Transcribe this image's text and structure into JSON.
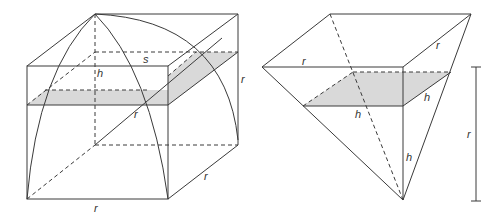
{
  "figure": {
    "left": {
      "title": "Cube containing quarter hemisphere with horizontal cross-section",
      "labels": {
        "s": "s",
        "h": "h",
        "r_diag": "r",
        "r_right": "r",
        "r_depth": "r",
        "r_bottom": "r"
      }
    },
    "right": {
      "title": "Inverted square pyramid with horizontal cross-section",
      "labels": {
        "r_left_top": "r",
        "r_right_top": "r",
        "h_side": "h",
        "h_front": "h",
        "h_vertical": "h",
        "r_scale": "r"
      }
    },
    "colors": {
      "line": "#3a3a3a",
      "shade": "#d9d9d9",
      "background": "#ffffff"
    }
  }
}
